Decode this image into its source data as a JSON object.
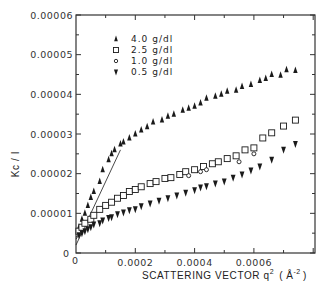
{
  "chart_data": {
    "type": "scatter",
    "title": "",
    "xlabel": "SCATTERING VECTOR q² (Å⁻²)",
    "xlabel_parts": {
      "main": "SCATTERING VECTOR q",
      "sup": "2",
      "unit_open": "(",
      "unit": "Å",
      "unit_sup": "-2",
      "unit_close": ")"
    },
    "ylabel": "Kc / I",
    "xlim": [
      0,
      0.0008
    ],
    "ylim": [
      0,
      6e-05
    ],
    "x_ticks": [
      0,
      0.0002,
      0.0004,
      0.0006
    ],
    "x_tick_labels": [
      "0",
      "0.0002",
      "0.0004",
      "0.0006"
    ],
    "y_ticks": [
      0,
      1e-05,
      2e-05,
      3e-05,
      4e-05,
      5e-05,
      6e-05
    ],
    "y_tick_labels": [
      "0",
      "0.00001",
      "0.00002",
      "0.00003",
      "0.00004",
      "0.00005",
      "0.00006"
    ],
    "grid": false,
    "legend_position": "upper left inside",
    "series": [
      {
        "name": "4.0 g/dl",
        "marker": "filled-triangle-up",
        "x": [
          1e-05,
          2e-05,
          3e-05,
          4e-05,
          5e-05,
          6e-05,
          8e-05,
          9e-05,
          0.00011,
          0.00012,
          0.00013,
          0.00015,
          0.00016,
          0.00018,
          0.0002,
          0.00022,
          0.00024,
          0.00026,
          0.00029,
          0.00031,
          0.00033,
          0.00036,
          0.00038,
          0.0004,
          0.00042,
          0.00044,
          0.00047,
          0.00049,
          0.00051,
          0.00054,
          0.00056,
          0.00059,
          0.00062,
          0.00064,
          0.00066,
          0.00069,
          0.00071,
          0.00074
        ],
        "y": [
          6.5e-06,
          8.5e-06,
          1e-05,
          1.2e-05,
          1.4e-05,
          1.55e-05,
          1.8e-05,
          2.1e-05,
          2.35e-05,
          2.5e-05,
          2.6e-05,
          2.75e-05,
          2.8e-05,
          2.9e-05,
          3e-05,
          3.1e-05,
          3.18e-05,
          3.3e-05,
          3.35e-05,
          3.45e-05,
          3.5e-05,
          3.6e-05,
          3.65e-05,
          3.7e-05,
          3.78e-05,
          3.9e-05,
          3.95e-05,
          4e-05,
          4.08e-05,
          4.1e-05,
          4.2e-05,
          4.25e-05,
          4.35e-05,
          4.4e-05,
          4.5e-05,
          4.48e-05,
          4.62e-05,
          4.6e-05
        ]
      },
      {
        "name": "2.5 g/dl",
        "marker": "open-square",
        "x": [
          1e-05,
          2e-05,
          3e-05,
          5e-05,
          6e-05,
          8e-05,
          0.0001,
          0.00012,
          0.00014,
          0.00016,
          0.00018,
          0.0002,
          0.00022,
          0.00025,
          0.00027,
          0.0003,
          0.00032,
          0.00035,
          0.00037,
          0.0004,
          0.00043,
          0.00046,
          0.00048,
          0.00051,
          0.00054,
          0.00057,
          0.0006,
          0.00063,
          0.00066,
          0.0007,
          0.00074
        ],
        "y": [
          5.5e-06,
          6.5e-06,
          7.5e-06,
          8.5e-06,
          9.5e-06,
          1.1e-05,
          1.2e-05,
          1.28e-05,
          1.38e-05,
          1.45e-05,
          1.55e-05,
          1.6e-05,
          1.67e-05,
          1.75e-05,
          1.8e-05,
          1.88e-05,
          1.9e-05,
          1.98e-05,
          2.05e-05,
          2.1e-05,
          2.18e-05,
          2.25e-05,
          2.3e-05,
          2.38e-05,
          2.45e-05,
          2.6e-05,
          2.65e-05,
          2.9e-05,
          3.03e-05,
          3.2e-05,
          3.35e-05
        ]
      },
      {
        "name": "1.0 g/dl",
        "marker": "open-circle",
        "x": [
          0.00038,
          0.00042,
          0.00044,
          0.00055,
          0.0006
        ],
        "y": [
          1.95e-05,
          2.05e-05,
          2.1e-05,
          2.3e-05,
          2.5e-05
        ]
      },
      {
        "name": "0.5 g/dl",
        "marker": "filled-triangle-down",
        "x": [
          1e-05,
          2e-05,
          3e-05,
          4e-05,
          5e-05,
          6e-05,
          8e-05,
          9e-05,
          0.00011,
          0.00012,
          0.00014,
          0.00016,
          0.00018,
          0.0002,
          0.00022,
          0.00025,
          0.00028,
          0.00031,
          0.00034,
          0.00037,
          0.0004,
          0.00042,
          0.00044,
          0.00047,
          0.0005,
          0.00053,
          0.00056,
          0.00059,
          0.00062,
          0.00066,
          0.0007,
          0.00074
        ],
        "y": [
          4.5e-06,
          5e-06,
          5.5e-06,
          6e-06,
          6.5e-06,
          7.2e-06,
          7.5e-06,
          8.2e-06,
          8.8e-06,
          9e-06,
          9.8e-06,
          1.02e-05,
          1.08e-05,
          1.1e-05,
          1.18e-05,
          1.25e-05,
          1.32e-05,
          1.38e-05,
          1.45e-05,
          1.52e-05,
          1.58e-05,
          1.65e-05,
          1.68e-05,
          1.75e-05,
          1.8e-05,
          1.9e-05,
          1.98e-05,
          2.08e-05,
          2.18e-05,
          2.35e-05,
          2.6e-05,
          2.75e-05
        ]
      }
    ],
    "fit_lines": [
      {
        "name": "4.0 fit",
        "x": [
          0,
          0.00015
        ],
        "y": [
          2e-06,
          2.6e-05
        ]
      },
      {
        "name": "2.5 fit",
        "x": [
          0,
          5e-05
        ],
        "y": [
          3.5e-06,
          9e-06
        ]
      },
      {
        "name": "0.5 fit",
        "x": [
          0,
          3e-05
        ],
        "y": [
          4e-06,
          6e-06
        ]
      }
    ],
    "origin_labels": {
      "x": "0",
      "y": "0"
    }
  },
  "legend": {
    "items": [
      {
        "label": "4.0 g/dl",
        "marker": "filled-triangle-up"
      },
      {
        "label": "2.5 g/dl",
        "marker": "open-square"
      },
      {
        "label": "1.0 g/dl",
        "marker": "open-circle"
      },
      {
        "label": "0.5 g/dl",
        "marker": "filled-triangle-down"
      }
    ]
  },
  "colors": {
    "ink": "#1a1a1a",
    "axis": "#333333",
    "background": "#ffffff"
  }
}
